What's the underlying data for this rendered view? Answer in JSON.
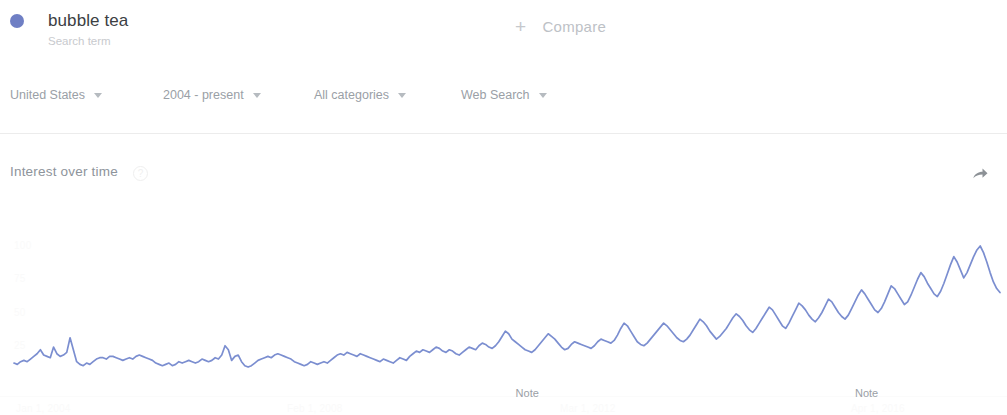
{
  "header": {
    "term": "bubble tea",
    "term_subtitle": "Search term",
    "dot_color": "#6f7fc4",
    "compare_label": "Compare",
    "compare_plus": "+"
  },
  "filters": [
    {
      "label": "United States",
      "left": 10
    },
    {
      "label": "2004 - present",
      "left": 163
    },
    {
      "label": "All categories",
      "left": 314
    },
    {
      "label": "Web Search",
      "left": 461
    }
  ],
  "card": {
    "title": "Interest over time",
    "help_icon": "?",
    "share_icon": "share-arrow"
  },
  "chart_data": {
    "type": "line",
    "title": "Interest over time",
    "xlabel": "",
    "ylabel": "",
    "ylim": [
      0,
      100
    ],
    "yticks": [
      "100",
      "75",
      "50",
      "25"
    ],
    "xticks": [
      "Jan 1, 2004",
      "Feb 1, 2008",
      "Mar 1, 2012",
      "Apr 1, 2016"
    ],
    "grid": false,
    "legend_position": "top-left",
    "line_color": "#7b8ed0",
    "series": [
      {
        "name": "bubble tea",
        "values": [
          12,
          11,
          13,
          14,
          13,
          15,
          17,
          19,
          22,
          18,
          17,
          16,
          24,
          19,
          17,
          18,
          20,
          31,
          22,
          13,
          11,
          10,
          12,
          11,
          13,
          15,
          16,
          16,
          15,
          17,
          17,
          16,
          15,
          14,
          15,
          16,
          15,
          17,
          18,
          17,
          16,
          15,
          14,
          12,
          11,
          10,
          11,
          12,
          10,
          11,
          13,
          12,
          13,
          14,
          13,
          12,
          13,
          15,
          14,
          13,
          14,
          16,
          15,
          18,
          25,
          22,
          14,
          17,
          18,
          13,
          10,
          9,
          10,
          12,
          14,
          15,
          16,
          17,
          16,
          18,
          19,
          18,
          17,
          16,
          15,
          13,
          12,
          11,
          10,
          11,
          13,
          12,
          11,
          12,
          13,
          12,
          14,
          16,
          18,
          19,
          18,
          20,
          19,
          18,
          17,
          19,
          18,
          17,
          16,
          15,
          14,
          13,
          15,
          14,
          13,
          12,
          14,
          16,
          15,
          14,
          17,
          19,
          21,
          20,
          22,
          21,
          20,
          22,
          24,
          23,
          21,
          20,
          22,
          21,
          19,
          18,
          20,
          22,
          24,
          23,
          22,
          25,
          27,
          26,
          24,
          23,
          25,
          28,
          32,
          36,
          34,
          30,
          28,
          26,
          24,
          22,
          21,
          20,
          22,
          25,
          28,
          31,
          34,
          32,
          30,
          27,
          24,
          22,
          23,
          26,
          28,
          27,
          26,
          25,
          24,
          23,
          25,
          28,
          30,
          29,
          28,
          27,
          29,
          33,
          38,
          42,
          40,
          36,
          32,
          28,
          26,
          25,
          27,
          30,
          33,
          36,
          39,
          42,
          40,
          37,
          34,
          31,
          29,
          28,
          30,
          33,
          37,
          41,
          45,
          43,
          40,
          36,
          33,
          30,
          32,
          35,
          38,
          42,
          46,
          49,
          47,
          44,
          40,
          37,
          35,
          38,
          42,
          46,
          50,
          54,
          52,
          48,
          44,
          40,
          38,
          42,
          47,
          52,
          57,
          55,
          52,
          48,
          45,
          43,
          46,
          50,
          55,
          60,
          58,
          54,
          50,
          47,
          45,
          48,
          53,
          58,
          63,
          67,
          64,
          60,
          56,
          52,
          50,
          53,
          58,
          64,
          70,
          68,
          64,
          60,
          56,
          58,
          63,
          69,
          75,
          80,
          77,
          72,
          68,
          64,
          62,
          66,
          72,
          79,
          86,
          92,
          88,
          82,
          76,
          80,
          86,
          92,
          97,
          100,
          95,
          88,
          80,
          73,
          68,
          65
        ]
      }
    ],
    "annotations": [
      {
        "label": "Note",
        "x_fraction": 0.512
      },
      {
        "label": "Note",
        "x_fraction": 0.849
      }
    ]
  }
}
